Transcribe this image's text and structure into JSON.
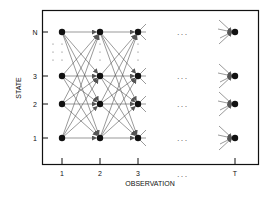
{
  "diagram": {
    "y_axis_label": "STATE",
    "x_axis_label": "OBSERVATION",
    "states": [
      "1",
      "2",
      "3",
      "N"
    ],
    "observations": [
      "1",
      "2",
      "3",
      "T"
    ],
    "ellipsis": ". . .",
    "vertical_ellipsis": ":",
    "full_transitions_between": [
      [
        "1",
        "2"
      ],
      [
        "2",
        "3"
      ]
    ],
    "partial_arrows_into": "T",
    "colors": {
      "ink": "#111111",
      "edge": "#555555",
      "background": "#ffffff"
    }
  }
}
